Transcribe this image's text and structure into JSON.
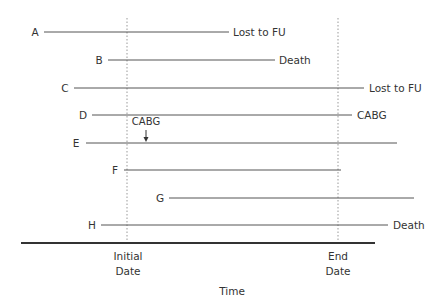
{
  "diagram": {
    "type": "follow-up timeline",
    "colors": {
      "line": "#555555",
      "text": "#333333",
      "axis": "#333333",
      "dotted": "#999999"
    },
    "reference_lines": [
      {
        "id": "initial",
        "label_line1": "Initial",
        "label_line2": "Date",
        "x": 127
      },
      {
        "id": "end",
        "label_line1": "End",
        "label_line2": "Date",
        "x": 338
      }
    ],
    "axis": {
      "label": "Time",
      "x1": 21,
      "x2": 375,
      "y": 243
    },
    "subjects": [
      {
        "id": "A",
        "label": "A",
        "y": 32,
        "x1": 44,
        "x2": 229,
        "outcome": "Lost to FU"
      },
      {
        "id": "B",
        "label": "B",
        "y": 60,
        "x1": 108,
        "x2": 275,
        "outcome": "Death"
      },
      {
        "id": "C",
        "label": "C",
        "y": 88,
        "x1": 74,
        "x2": 364,
        "outcome": "Lost to FU"
      },
      {
        "id": "D",
        "label": "D",
        "y": 115,
        "x1": 92,
        "x2": 352,
        "outcome": "CABG"
      },
      {
        "id": "E",
        "label": "E",
        "y": 143,
        "x1": 86,
        "x2": 397,
        "outcome": ""
      },
      {
        "id": "F",
        "label": "F",
        "y": 170,
        "x1": 124,
        "x2": 341,
        "outcome": ""
      },
      {
        "id": "G",
        "label": "G",
        "y": 198,
        "x1": 169,
        "x2": 414,
        "outcome": ""
      },
      {
        "id": "H",
        "label": "H",
        "y": 225,
        "x1": 101,
        "x2": 388,
        "outcome": "Death"
      }
    ],
    "annotation": {
      "label": "CABG",
      "x": 146,
      "target_subject": "E"
    }
  }
}
